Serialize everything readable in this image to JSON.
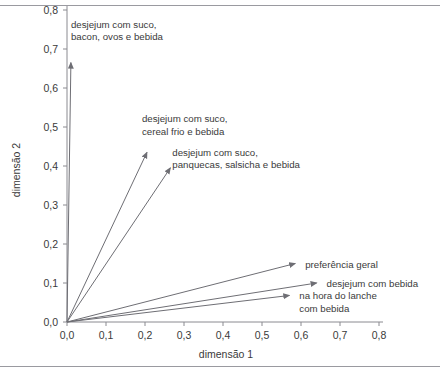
{
  "figure": {
    "frame": {
      "top_rule": "hr-top",
      "bottom_rule": "hr-bottom"
    },
    "background_color": "#ffffff",
    "line_color": "#6e6e74",
    "text_color": "#3a3a3a"
  },
  "chart_data": {
    "type": "scatter",
    "subtype": "vector-biplot",
    "title": "",
    "xlabel": "dimensão 1",
    "ylabel": "dimensão 2",
    "xlim": [
      0.0,
      0.8
    ],
    "ylim": [
      0.0,
      0.8
    ],
    "xticks": [
      "0,0",
      "0,1",
      "0,2",
      "0,3",
      "0,4",
      "0,5",
      "0,6",
      "0,7",
      "0,8"
    ],
    "yticks": [
      "0,0",
      "0,1",
      "0,2",
      "0,3",
      "0,4",
      "0,5",
      "0,6",
      "0,7",
      "0,8"
    ],
    "xtick_values": [
      0.0,
      0.1,
      0.2,
      0.3,
      0.4,
      0.5,
      0.6,
      0.7,
      0.8
    ],
    "ytick_values": [
      0.0,
      0.1,
      0.2,
      0.3,
      0.4,
      0.5,
      0.6,
      0.7,
      0.8
    ],
    "grid": false,
    "legend": "none",
    "origin": [
      0.0,
      0.0
    ],
    "vectors": [
      {
        "label": "desjejum com suco,\nbacon, ovos e bebida",
        "label_lines": [
          "desjejum com suco,",
          "bacon, ovos e bebida"
        ],
        "x": 0.01,
        "y": 0.665
      },
      {
        "label": "desjejum com suco,\ncereal frio e bebida",
        "label_lines": [
          "desjejum com suco,",
          "cereal frio e bebida"
        ],
        "x": 0.205,
        "y": 0.435
      },
      {
        "label": "desjejum com suco,\npanquecas, salsicha e bebida",
        "label_lines": [
          "desjejum com suco,",
          "panquecas, salsicha e bebida"
        ],
        "x": 0.265,
        "y": 0.395
      },
      {
        "label": "preferência geral",
        "label_lines": [
          "preferência geral"
        ],
        "x": 0.585,
        "y": 0.15
      },
      {
        "label": "desjejum com bebida",
        "label_lines": [
          "desjejum com bebida"
        ],
        "x": 0.64,
        "y": 0.1
      },
      {
        "label": "na hora do lanche\ncom bebida",
        "label_lines": [
          "na hora do lanche",
          "com bebida"
        ],
        "x": 0.57,
        "y": 0.068
      }
    ]
  }
}
